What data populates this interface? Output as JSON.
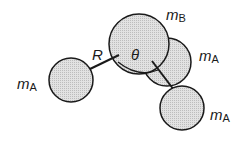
{
  "diagram": {
    "labels": {
      "central_atom": {
        "m": "m",
        "sub": "B"
      },
      "atom_right": {
        "m": "m",
        "sub": "A"
      },
      "atom_left": {
        "m": "m",
        "sub": "A"
      },
      "atom_lower_right": {
        "m": "m",
        "sub": "A"
      },
      "bond_length": "R",
      "angle": "θ"
    },
    "colors": {
      "fill": "#d9d9d9",
      "stroke": "#1a1a1a"
    }
  }
}
